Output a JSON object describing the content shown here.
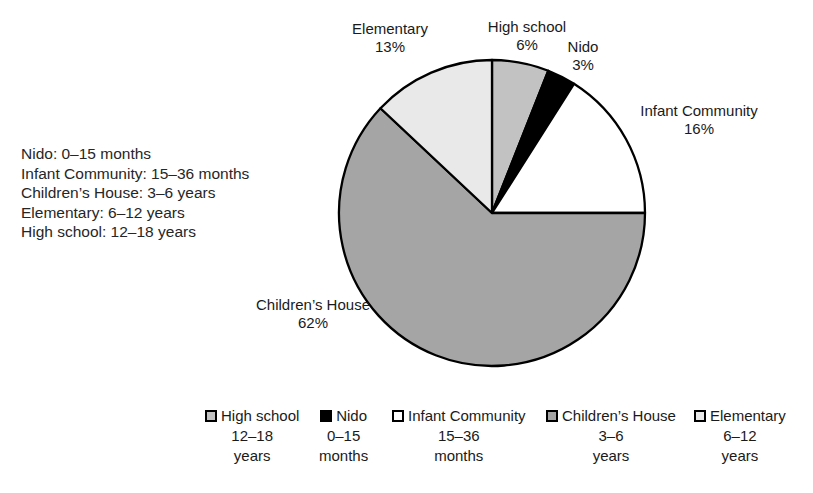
{
  "background_color": "#ffffff",
  "info_block": {
    "lines": [
      "Nido: 0–15 months",
      "Infant Community: 15–36 months",
      "Children’s House: 3–6 years",
      "Elementary: 6–12 years",
      "High school: 12–18 years"
    ]
  },
  "chart_data": {
    "type": "pie",
    "title": "",
    "categories": [
      "High school",
      "Nido",
      "Infant Community",
      "Children's House",
      "Elementary"
    ],
    "values": [
      6,
      3,
      16,
      62,
      13
    ],
    "unit": "%",
    "start_angle_deg": -90,
    "direction": "clockwise",
    "slice_colors": [
      "#c2c2c2",
      "#000000",
      "#ffffff",
      "#a5a5a5",
      "#e9e9e9"
    ],
    "stroke_color": "#000000",
    "legend_position": "bottom",
    "age_ranges": {
      "Nido": "0–15 months",
      "Infant Community": "15–36 months",
      "Children's House": "3–6 years",
      "Elementary": "6–12 years",
      "High school": "12–18 years"
    }
  },
  "slice_labels": [
    {
      "name": "High school",
      "value": "6%"
    },
    {
      "name": "Nido",
      "value": "3%"
    },
    {
      "name": "Infant Community",
      "value": "16%"
    },
    {
      "name": "Children’s House",
      "value": "62%"
    },
    {
      "name": "Elementary",
      "value": "13%"
    }
  ],
  "legend": {
    "items": [
      {
        "name": "High school",
        "range": "12–18",
        "unit": "years"
      },
      {
        "name": "Nido",
        "range": "0–15",
        "unit": "months"
      },
      {
        "name": "Infant Community",
        "range": "15–36",
        "unit": "months"
      },
      {
        "name": "Children’s House",
        "range": "3–6",
        "unit": "years"
      },
      {
        "name": "Elementary",
        "range": "6–12",
        "unit": "years"
      }
    ]
  }
}
